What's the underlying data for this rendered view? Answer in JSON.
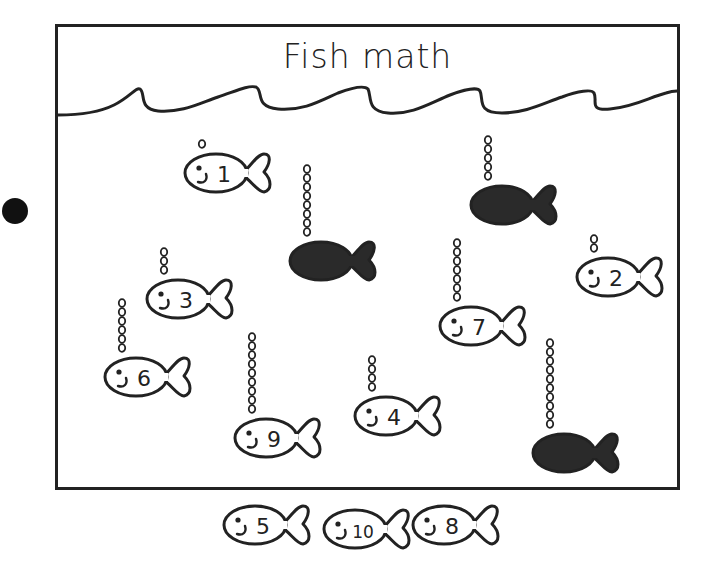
{
  "worksheet": {
    "title": "Fish math",
    "instructions_bullet": "black-dot",
    "colors": {
      "ink": "#222222",
      "dark_fish": "#2a2a2a",
      "paper": "#ffffff"
    }
  },
  "tank_fish": [
    {
      "id": "fish-1",
      "label": "1",
      "filled": false,
      "x": 186,
      "y": 150,
      "bubbles": 1
    },
    {
      "id": "dark-fish-a",
      "label": "",
      "filled": true,
      "x": 291,
      "y": 238,
      "bubbles": 8
    },
    {
      "id": "dark-fish-b",
      "label": "",
      "filled": true,
      "x": 472,
      "y": 182,
      "bubbles": 5
    },
    {
      "id": "fish-2",
      "label": "2",
      "filled": false,
      "x": 578,
      "y": 254,
      "bubbles": 2
    },
    {
      "id": "fish-3",
      "label": "3",
      "filled": false,
      "x": 148,
      "y": 276,
      "bubbles": 3
    },
    {
      "id": "fish-7",
      "label": "7",
      "filled": false,
      "x": 441,
      "y": 303,
      "bubbles": 7
    },
    {
      "id": "fish-6",
      "label": "6",
      "filled": false,
      "x": 106,
      "y": 354,
      "bubbles": 6
    },
    {
      "id": "fish-4",
      "label": "4",
      "filled": false,
      "x": 356,
      "y": 393,
      "bubbles": 4
    },
    {
      "id": "fish-9",
      "label": "9",
      "filled": false,
      "x": 236,
      "y": 415,
      "bubbles": 9
    },
    {
      "id": "dark-fish-c",
      "label": "",
      "filled": true,
      "x": 534,
      "y": 430,
      "bubbles": 10
    }
  ],
  "answer_fish": [
    {
      "id": "answer-5",
      "label": "5",
      "x": 225,
      "y": 502
    },
    {
      "id": "answer-10",
      "label": "10",
      "x": 325,
      "y": 506
    },
    {
      "id": "answer-8",
      "label": "8",
      "x": 414,
      "y": 502
    }
  ]
}
